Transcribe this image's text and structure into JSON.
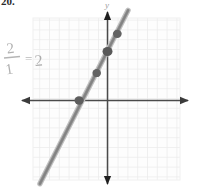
{
  "page": {
    "width": 197,
    "height": 190,
    "background": "#ffffff",
    "problem_number": "20."
  },
  "annotation": {
    "slope_fraction": {
      "numerator": "2",
      "denominator": "1",
      "equals": "=",
      "result": "2",
      "full_text": "2/1 = 2",
      "color": "#b9b9b9"
    }
  },
  "chart_data": {
    "type": "line",
    "title": "",
    "xlabel": "",
    "ylabel": "y",
    "grid": true,
    "legend": null,
    "xlim": [
      -7.4,
      7.3
    ],
    "ylim": [
      -8.5,
      9.0
    ],
    "axis_color": "#4a4a4a",
    "grid_color": "#ededed",
    "line_color": "#9a9a9a",
    "point_color": "#5a5a5a",
    "series": [
      {
        "name": "line",
        "slope": 2,
        "intercept": 5,
        "equation": "y = 2x + 5",
        "endpoints": [
          [
            -6.9,
            -8.5
          ],
          [
            2.1,
            9.2
          ]
        ],
        "points": [
          {
            "x": -2.9,
            "y": 0.0
          },
          {
            "x": -1.1,
            "y": 2.8
          },
          {
            "x": 0.0,
            "y": 5.0
          },
          {
            "x": 1.0,
            "y": 6.8
          }
        ]
      }
    ],
    "axes": {
      "x_axis": {
        "y_px": 100,
        "x_start_px": 20,
        "x_end_px": 190,
        "arrows": "both"
      },
      "y_axis": {
        "x_px": 107,
        "y_start_px": 10,
        "y_end_px": 186,
        "arrows": "both"
      }
    }
  }
}
